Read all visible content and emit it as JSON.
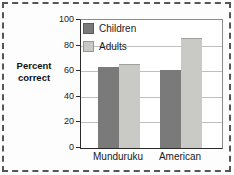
{
  "figure": {
    "background": "#fdfdfd",
    "dashed_border_color": "#565656"
  },
  "chart_data": {
    "type": "bar",
    "title": "",
    "ylabel": "Percent correct",
    "ylabel_lines": [
      "Percent",
      "correct"
    ],
    "categories": [
      "Munduruku",
      "American"
    ],
    "series": [
      {
        "name": "Children",
        "color": "#7a7a7a",
        "values": [
          63,
          61
        ]
      },
      {
        "name": "Adults",
        "color": "#c9c9c5",
        "values": [
          65,
          85
        ]
      }
    ],
    "ylim": [
      0,
      100
    ],
    "yticks": [
      0,
      20,
      40,
      60,
      80,
      100
    ],
    "grid": true,
    "gridline_color": "#bfbfbf",
    "legend_position": "top-left"
  }
}
